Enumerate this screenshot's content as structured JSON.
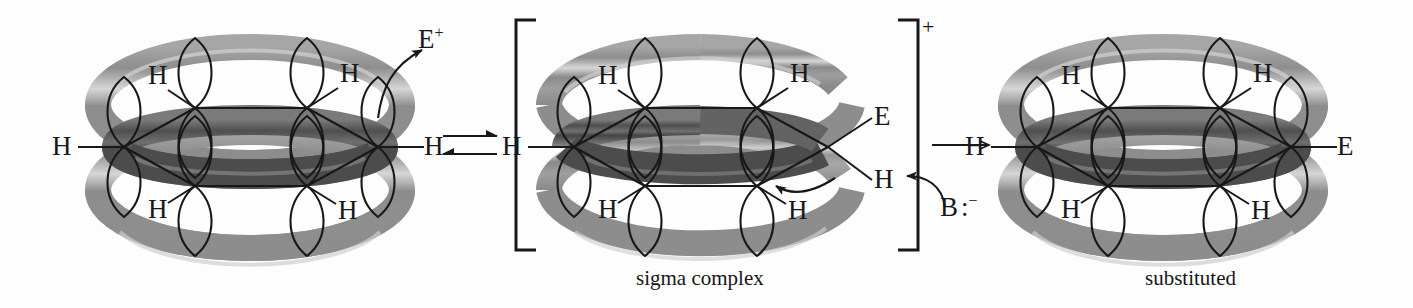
{
  "figure": {
    "kind": "reaction-mechanism",
    "topic": "electrophilic-aromatic-substitution",
    "background_color": "#fdfdfd",
    "ink_color": "#18181a",
    "torus_outer_color": "#9b9b9b",
    "torus_mid_color": "#7e7e7e",
    "torus_dark_color": "#5a5a5a",
    "torus_highlight_color": "#d8d8d8"
  },
  "structures": [
    {
      "id": "benzene",
      "name": "benzene",
      "caption": "",
      "hydrogens": [
        "H",
        "H",
        "H",
        "H",
        "H",
        "H"
      ],
      "substituent": null,
      "bracketed": false,
      "charge": ""
    },
    {
      "id": "sigma-complex",
      "name": "sigma complex",
      "caption": "sigma complex",
      "hydrogens": [
        "H",
        "H",
        "H",
        "H",
        "H"
      ],
      "sp3_labels": {
        "top": "E",
        "bottom": "H"
      },
      "bracketed": true,
      "charge": "+"
    },
    {
      "id": "substituted",
      "name": "substituted arene",
      "caption": "substituted",
      "hydrogens": [
        "H",
        "H",
        "H",
        "H",
        "H"
      ],
      "substituent": "E",
      "bracketed": false,
      "charge": ""
    }
  ],
  "reagents": {
    "electrophile": {
      "symbol": "E",
      "charge": "+",
      "label": "E+"
    },
    "base": {
      "symbol": "B",
      "lone_pair": ":",
      "charge": "−",
      "label": "B:−"
    }
  },
  "arrows": {
    "equilibrium": {
      "name": "equilibrium-arrow",
      "glyph": "⇌",
      "direction": "both"
    },
    "forward": {
      "name": "reaction-arrow",
      "glyph": "→",
      "direction": "right"
    },
    "curved_electrophile": {
      "name": "curly-arrow-to-electrophile"
    },
    "curved_base": {
      "name": "curly-arrow-base-abstracts-proton"
    },
    "curved_sigma": {
      "name": "curly-arrow-sigma-complex"
    }
  },
  "captions": {
    "sigma_complex": "sigma complex",
    "substituted": "substituted"
  },
  "atom_labels": {
    "hydrogen": "H",
    "electrophile": "E",
    "base": "B",
    "plus": "+",
    "minus": "−",
    "lone_pair": ":"
  }
}
